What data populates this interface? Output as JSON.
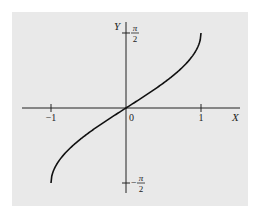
{
  "chart_data": {
    "type": "line",
    "title": "",
    "xlabel": "X",
    "ylabel": "Y",
    "function": "Y = arcsin(X)",
    "xlim": [
      -1.3,
      1.3
    ],
    "ylim": [
      -1.75,
      1.75
    ],
    "x_ticks": [
      {
        "value": -1,
        "label": "−1"
      },
      {
        "value": 0,
        "label": "0"
      },
      {
        "value": 1,
        "label": "1"
      }
    ],
    "y_ticks": [
      {
        "value": 1.5708,
        "label_num": "π",
        "label_den": "2",
        "sign": ""
      },
      {
        "value": -1.5708,
        "label_num": "π",
        "label_den": "2",
        "sign": "−"
      }
    ],
    "grid": false,
    "series": [
      {
        "name": "arcsin",
        "x": [
          -1,
          -0.9,
          -0.75,
          -0.5,
          -0.25,
          0,
          0.25,
          0.5,
          0.75,
          0.9,
          1
        ],
        "y": [
          -1.5708,
          -1.1198,
          -0.8481,
          -0.5236,
          -0.2527,
          0,
          0.2527,
          0.5236,
          0.8481,
          1.1198,
          1.5708
        ]
      }
    ],
    "background": "#e9e9e9",
    "line_color": "#111111"
  }
}
